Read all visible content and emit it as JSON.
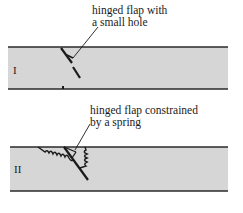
{
  "diagram": {
    "panels": [
      {
        "id": "I",
        "roman_label": "I",
        "callout_line1": "hinged flap with",
        "callout_line2": "a small hole"
      },
      {
        "id": "II",
        "roman_label": "II",
        "callout_line1": "hinged flap constrained",
        "callout_line2": "by a spring"
      }
    ],
    "colors": {
      "pipe_fill": "#d4d4d4",
      "pipe_wall": "#2a2a2a",
      "ink": "#1a1a1a"
    }
  }
}
